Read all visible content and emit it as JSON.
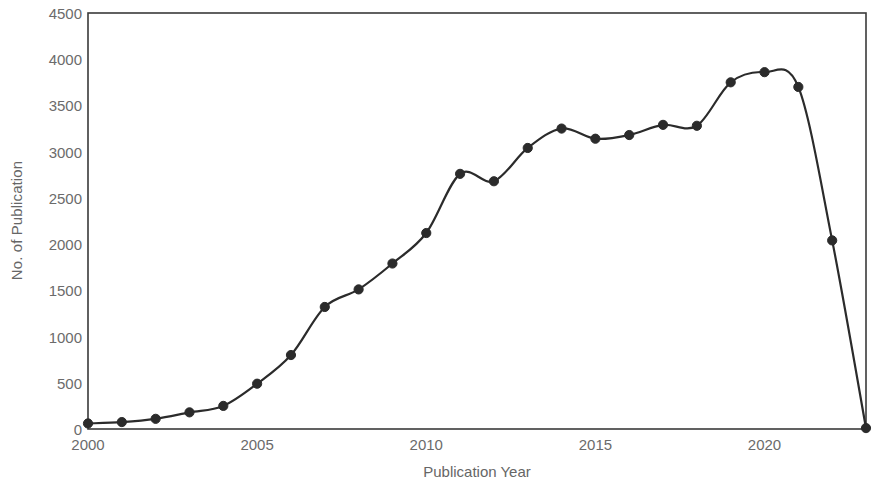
{
  "chart_data": {
    "type": "line",
    "title": "",
    "xlabel": "Publication Year",
    "ylabel": "No. of Publication",
    "xlim": [
      2000,
      2023
    ],
    "ylim": [
      0,
      4500
    ],
    "grid": false,
    "legend": null,
    "x": [
      2000,
      2001,
      2002,
      2003,
      2004,
      2005,
      2006,
      2007,
      2008,
      2009,
      2010,
      2011,
      2012,
      2013,
      2014,
      2015,
      2016,
      2017,
      2018,
      2019,
      2020,
      2021,
      2022,
      2023
    ],
    "values": [
      60,
      75,
      110,
      180,
      250,
      490,
      800,
      1320,
      1510,
      1790,
      2120,
      2760,
      2680,
      3040,
      3250,
      3140,
      3180,
      3290,
      3280,
      3750,
      3860,
      3700,
      2040,
      10
    ],
    "series": [
      {
        "name": "No. of Publication",
        "values": [
          60,
          75,
          110,
          180,
          250,
          490,
          800,
          1320,
          1510,
          1790,
          2120,
          2760,
          2680,
          3040,
          3250,
          3140,
          3180,
          3290,
          3280,
          3750,
          3860,
          3700,
          2040,
          10
        ],
        "color": "#2b2b2b",
        "marker": "circle"
      }
    ],
    "ytick_labels": [
      "0",
      "500",
      "1000",
      "1500",
      "2000",
      "2500",
      "3000",
      "3500",
      "4000",
      "4500"
    ],
    "ytick_values": [
      0,
      500,
      1000,
      1500,
      2000,
      2500,
      3000,
      3500,
      4000,
      4500
    ],
    "xtick_labels": [
      "2000",
      "2005",
      "2010",
      "2015",
      "2020"
    ],
    "xtick_values": [
      2000,
      2005,
      2010,
      2015,
      2020
    ],
    "colors": {
      "line": "#2b2b2b",
      "marker": "#2b2b2b",
      "frame": "#3a3a3a",
      "tick_text": "#6b6b6b",
      "axis_title": "#666666",
      "background": "#ffffff"
    }
  }
}
